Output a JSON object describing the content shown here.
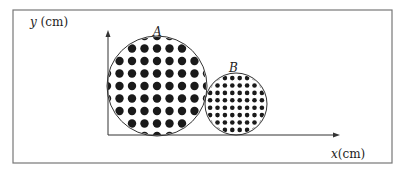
{
  "diagram": {
    "axes": {
      "y_label": "y (cm)",
      "x_label": "x(cm)"
    },
    "circles": [
      {
        "label": "A",
        "cx": 157,
        "cy": 86,
        "r": 50,
        "dot_spacing": 12.5,
        "dot_r": 4.2
      },
      {
        "label": "B",
        "cx": 236,
        "cy": 104,
        "r": 31,
        "dot_spacing": 7.4,
        "dot_r": 2.3
      }
    ],
    "colors": {
      "stroke": "#333333",
      "dot": "#1a1a1a",
      "frame": "#777777"
    }
  }
}
